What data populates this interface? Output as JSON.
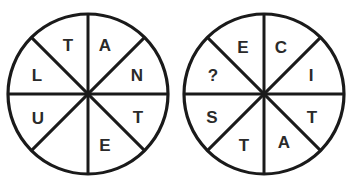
{
  "puzzle": {
    "circles": [
      {
        "name": "left-circle",
        "cx": 88,
        "cy": 94,
        "r": 80,
        "sectors": [
          {
            "label": "T",
            "x": 68,
            "y": 45
          },
          {
            "label": "A",
            "x": 105,
            "y": 45
          },
          {
            "label": "N",
            "x": 137,
            "y": 75
          },
          {
            "label": "T",
            "x": 138,
            "y": 117
          },
          {
            "label": "E",
            "x": 105,
            "y": 145
          },
          {
            "label": "",
            "x": 70,
            "y": 145
          },
          {
            "label": "U",
            "x": 38,
            "y": 118
          },
          {
            "label": "L",
            "x": 37,
            "y": 75
          }
        ]
      },
      {
        "name": "right-circle",
        "cx": 264,
        "cy": 94,
        "r": 80,
        "sectors": [
          {
            "label": "E",
            "x": 243,
            "y": 47
          },
          {
            "label": "C",
            "x": 281,
            "y": 47
          },
          {
            "label": "I",
            "x": 311,
            "y": 75
          },
          {
            "label": "T",
            "x": 312,
            "y": 117
          },
          {
            "label": "A",
            "x": 284,
            "y": 142
          },
          {
            "label": "T",
            "x": 244,
            "y": 145
          },
          {
            "label": "S",
            "x": 212,
            "y": 117
          },
          {
            "label": "?",
            "x": 213,
            "y": 75
          }
        ]
      }
    ],
    "colors": {
      "ink": "#1a1a1a",
      "background": "#ffffff"
    }
  }
}
